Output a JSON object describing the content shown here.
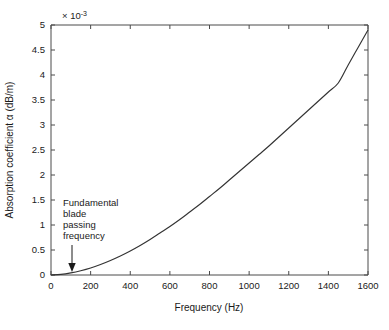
{
  "figure": {
    "background_color": "#ffffff",
    "axes_color": "#4a4a4a",
    "curve_color": "#333333"
  },
  "chart_data": {
    "type": "line",
    "title": "",
    "subtitle": "",
    "xlabel": "Frequency (Hz)",
    "ylabel": "Absorption coefficient α (dB/m)",
    "y_exponent_label": "× 10",
    "y_exponent_power": "-3",
    "y_scale": 0.001,
    "xlim": [
      0,
      1600
    ],
    "ylim": [
      0,
      5
    ],
    "xticks": [
      0,
      200,
      400,
      600,
      800,
      1000,
      1200,
      1400,
      1600
    ],
    "xticklabels": [
      "0",
      "200",
      "400",
      "600",
      "800",
      "1000",
      "1200",
      "1400",
      "1600"
    ],
    "yticks": [
      0,
      0.5,
      1,
      1.5,
      2,
      2.5,
      3,
      3.5,
      4,
      4.5,
      5
    ],
    "yticklabels": [
      "0",
      "0.5",
      "1",
      "1.5",
      "2",
      "2.5",
      "3",
      "3.5",
      "4",
      "4.5",
      "5"
    ],
    "grid": false,
    "legend": null,
    "series": [
      {
        "name": "Absorption coefficient",
        "color": "#333333",
        "x": [
          0,
          50,
          100,
          150,
          200,
          250,
          300,
          350,
          400,
          450,
          500,
          550,
          600,
          650,
          700,
          750,
          800,
          850,
          900,
          950,
          1000,
          1050,
          1100,
          1150,
          1200,
          1250,
          1300,
          1350,
          1400,
          1450,
          1500,
          1550,
          1600
        ],
        "y": [
          0.0,
          0.012,
          0.042,
          0.085,
          0.14,
          0.21,
          0.29,
          0.38,
          0.48,
          0.59,
          0.71,
          0.84,
          0.97,
          1.11,
          1.26,
          1.41,
          1.57,
          1.73,
          1.9,
          2.07,
          2.24,
          2.41,
          2.58,
          2.76,
          2.94,
          3.12,
          3.3,
          3.48,
          3.66,
          3.84,
          4.2,
          4.55,
          4.9
        ]
      }
    ],
    "annotations": [
      {
        "name": "fundamental-blade-passing-frequency",
        "lines": [
          "Fundamental",
          "blade",
          "passing",
          "frequency"
        ],
        "target_x": 105,
        "target_y": 0.05,
        "arrow": "down-arrow"
      }
    ]
  }
}
